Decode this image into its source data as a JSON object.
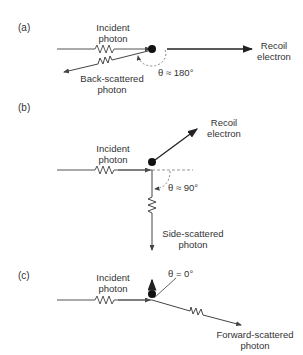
{
  "panels": [
    {
      "id": "a",
      "label": "(a)",
      "incident": [
        "Incident",
        "photon"
      ],
      "recoil": [
        "Recoil",
        "electron"
      ],
      "scattered": [
        "Back-scattered",
        "photon"
      ],
      "angle": "θ ≈ 180°"
    },
    {
      "id": "b",
      "label": "(b)",
      "incident": [
        "Incident",
        "photon"
      ],
      "recoil": [
        "Recoil",
        "electron"
      ],
      "scattered": [
        "Side-scattered",
        "photon"
      ],
      "angle": "θ ≈ 90°"
    },
    {
      "id": "c",
      "label": "(c)",
      "incident": [
        "Incident",
        "photon"
      ],
      "scattered": [
        "Forward-scattered",
        "photon"
      ],
      "angle": "θ = 0°"
    }
  ],
  "colors": {
    "line": "#333333",
    "dot": "#111111",
    "dashed": "#777777"
  }
}
